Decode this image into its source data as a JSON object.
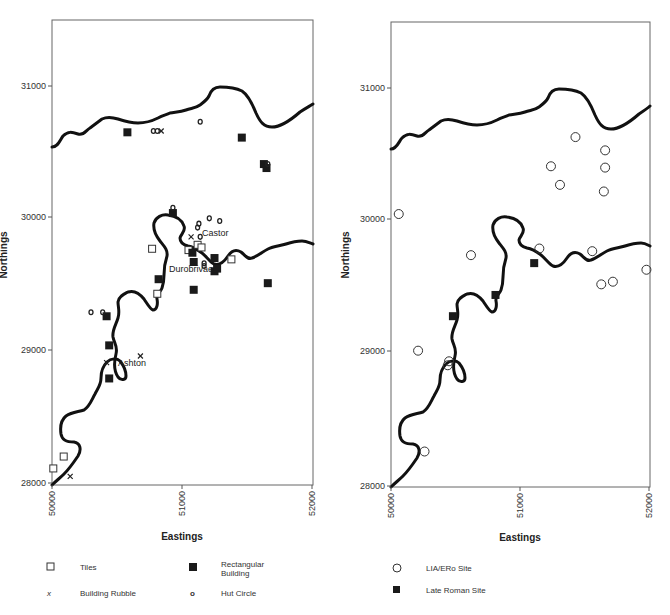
{
  "chart_data": [
    {
      "type": "scatter",
      "title": "",
      "xlabel": "Eastings",
      "ylabel": "Northings",
      "xlim": [
        50000,
        52000
      ],
      "ylim": [
        28000,
        31500
      ],
      "xticks": [
        "50000",
        "51000",
        "52000"
      ],
      "yticks": [
        "28000",
        "29000",
        "30000",
        "31000"
      ],
      "grid": false,
      "legend_position": "bottom",
      "place_labels": [
        {
          "text": "Castor",
          "x": 51120,
          "y": 29860
        },
        {
          "text": "Durobrivae",
          "x": 50840,
          "y": 29560
        },
        {
          "text": "Ashton",
          "x": 50430,
          "y": 28880
        }
      ],
      "series": [
        {
          "name": "Tiles",
          "marker": "open-square",
          "points": [
            [
              50010,
              28110
            ],
            [
              50090,
              28200
            ],
            [
              50770,
              29770
            ],
            [
              50810,
              29430
            ],
            [
              51050,
              29760
            ],
            [
              51120,
              29800
            ],
            [
              51150,
              29780
            ],
            [
              51380,
              29690
            ]
          ]
        },
        {
          "name": "Rectangular Building",
          "marker": "filled-square",
          "points": [
            [
              50580,
              30650
            ],
            [
              51460,
              30610
            ],
            [
              51630,
              30410
            ],
            [
              51650,
              30380
            ],
            [
              50930,
              30040
            ],
            [
              51080,
              29740
            ],
            [
              51250,
              29700
            ],
            [
              51090,
              29670
            ],
            [
              51250,
              29600
            ],
            [
              51270,
              29620
            ],
            [
              50820,
              29540
            ],
            [
              51090,
              29460
            ],
            [
              51660,
              29510
            ],
            [
              50420,
              29260
            ],
            [
              50440,
              29040
            ],
            [
              50440,
              28790
            ]
          ]
        },
        {
          "name": "Building Rubble",
          "marker": "x",
          "points": [
            [
              50840,
              30660
            ],
            [
              51070,
              29860
            ],
            [
              50420,
              28910
            ],
            [
              50680,
              28960
            ],
            [
              50140,
              28050
            ]
          ]
        },
        {
          "name": "Hut Circle",
          "marker": "o",
          "points": [
            [
              50780,
              30660
            ],
            [
              50810,
              30660
            ],
            [
              51140,
              30730
            ],
            [
              51660,
              30410
            ],
            [
              50930,
              30080
            ],
            [
              51210,
              30000
            ],
            [
              51290,
              29980
            ],
            [
              51130,
              29960
            ],
            [
              51120,
              29930
            ],
            [
              51140,
              29860
            ],
            [
              51170,
              29660
            ],
            [
              51170,
              29640
            ],
            [
              50300,
              29290
            ],
            [
              50390,
              29290
            ]
          ]
        }
      ]
    },
    {
      "type": "scatter",
      "title": "",
      "xlabel": "Eastings",
      "ylabel": "Northings",
      "xlim": [
        50000,
        52000
      ],
      "ylim": [
        28000,
        31500
      ],
      "xticks": [
        "50000",
        "51000",
        "52000"
      ],
      "yticks": [
        "28000",
        "29000",
        "30000",
        "31000"
      ],
      "grid": false,
      "legend_position": "bottom",
      "series": [
        {
          "name": "LIA/ERo Site",
          "marker": "open-circle",
          "points": [
            [
              50060,
              30050
            ],
            [
              51430,
              30630
            ],
            [
              51660,
              30530
            ],
            [
              51660,
              30400
            ],
            [
              51650,
              30220
            ],
            [
              51240,
              30410
            ],
            [
              51310,
              30270
            ],
            [
              50620,
              29740
            ],
            [
              51150,
              29790
            ],
            [
              51560,
              29770
            ],
            [
              51630,
              29520
            ],
            [
              51720,
              29540
            ],
            [
              51980,
              29630
            ],
            [
              50210,
              29020
            ],
            [
              50440,
              28910
            ],
            [
              50450,
              28940
            ],
            [
              50260,
              28260
            ]
          ]
        },
        {
          "name": "Late Roman Site",
          "marker": "filled-square",
          "points": [
            [
              51110,
              29680
            ],
            [
              50810,
              29440
            ],
            [
              50480,
              29280
            ]
          ]
        }
      ]
    }
  ],
  "left_panel": {
    "x_axis_title": "Eastings",
    "y_axis_title": "Northings",
    "x_ticks": [
      "50000",
      "51000",
      "52000"
    ],
    "y_ticks": [
      "31000",
      "30000",
      "29000",
      "28000"
    ],
    "labels": {
      "castor": "Castor",
      "durobrivae": "Durobrivae",
      "ashton": "Ashton"
    },
    "legend": {
      "tiles": "Tiles",
      "rect_line1": "Rectangular",
      "rect_line2": "Building",
      "rubble": "Building Rubble",
      "hut": "Hut Circle",
      "rubble_symbol": "x",
      "hut_symbol": "o"
    }
  },
  "right_panel": {
    "x_axis_title": "Eastings",
    "y_axis_title": "Northings",
    "x_ticks": [
      "50000",
      "51000",
      "52000"
    ],
    "y_ticks": [
      "31000",
      "30000",
      "29000",
      "28000"
    ],
    "legend": {
      "lia": "LIA/ERo Site",
      "late_roman": "Late Roman Site"
    }
  },
  "colors": {
    "river": "#111111",
    "frame": "#666666",
    "marker": "#1a1a1a"
  }
}
